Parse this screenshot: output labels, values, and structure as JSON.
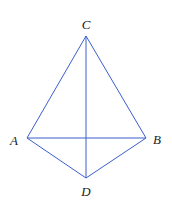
{
  "diagram": {
    "type": "geometry",
    "stroke_color": "#3a5fcd",
    "label_color": "#1a1a1a",
    "points": {
      "C": {
        "x": 86,
        "y": 36,
        "label": "C",
        "lx": 86,
        "ly": 24
      },
      "A": {
        "x": 27,
        "y": 138,
        "label": "A",
        "lx": 14,
        "ly": 140
      },
      "B": {
        "x": 146,
        "y": 138,
        "label": "B",
        "lx": 157,
        "ly": 139
      },
      "D": {
        "x": 86,
        "y": 178,
        "label": "D",
        "lx": 86,
        "ly": 191
      }
    },
    "segments": [
      [
        "C",
        "A"
      ],
      [
        "C",
        "B"
      ],
      [
        "C",
        "D"
      ],
      [
        "A",
        "B"
      ],
      [
        "A",
        "D"
      ],
      [
        "B",
        "D"
      ]
    ]
  }
}
